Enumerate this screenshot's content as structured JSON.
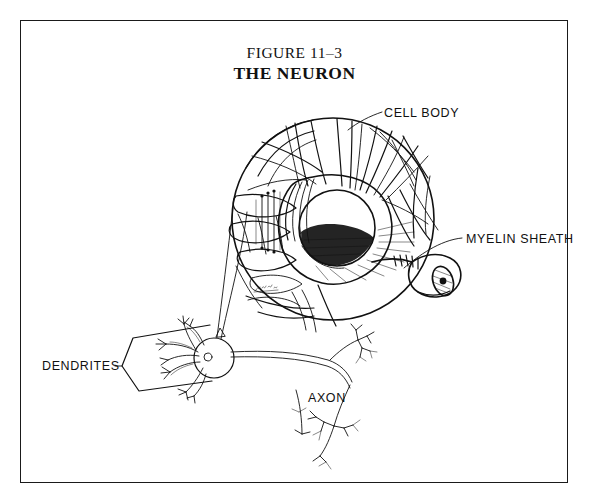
{
  "figure": {
    "title_line1": "FIGURE 11–3",
    "title_line2": "THE NEURON",
    "frame": {
      "border_color": "#1a1a1a",
      "background": "#ffffff"
    },
    "ink_color": "#111111"
  },
  "labels": {
    "cell_body": "CELL BODY",
    "myelin_sheath": "MYELIN SHEATH",
    "dendrites": "DENDRITES",
    "axon": "AXON"
  },
  "diagram": {
    "magnified_circle": {
      "name": "cell-body-magnification",
      "center_x": 333,
      "center_y": 219,
      "radius": 101,
      "contents": [
        "dendritic branches",
        "cytoplasm",
        "nucleus",
        "nucleolus",
        "axon hillock",
        "myelinated axon stub"
      ]
    },
    "small_neuron": {
      "name": "whole-neuron-schematic",
      "soma_center_x": 214,
      "soma_center_y": 358,
      "soma_radius": 20,
      "parts": [
        "dendrite tree",
        "soma",
        "axon",
        "axon terminals"
      ]
    },
    "leader_lines": [
      {
        "name": "cell-body-leader",
        "from": "label",
        "to": "circle edge top-right"
      },
      {
        "name": "myelin-sheath-leader",
        "from": "label",
        "to": "axon cut-away"
      },
      {
        "name": "dendrites-bracket",
        "shape": "wedge pointing left"
      }
    ],
    "magnification_cone": {
      "name": "magnification-cone",
      "description": "two lines linking small soma to large circle"
    },
    "artist_signature": {
      "name": "artist-signature",
      "x": 264,
      "y": 288
    }
  }
}
